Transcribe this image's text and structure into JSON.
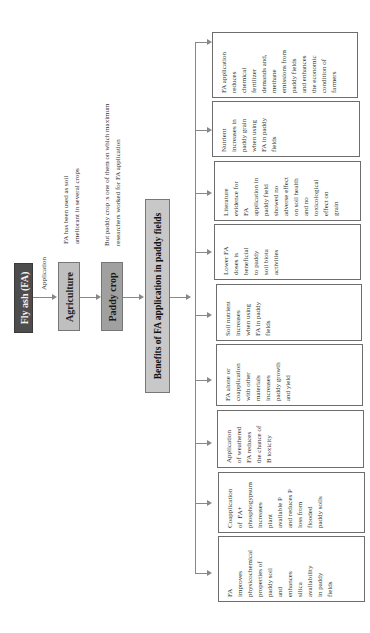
{
  "diagram": {
    "orientation": "rotated -90deg (text reads bottom-to-top)",
    "root": {
      "label": "Fly ash (FA)",
      "color": "#4d4d4d"
    },
    "edge_label_1": "Application",
    "node_agriculture": {
      "label": "Agriculture",
      "color": "#bfbfbf",
      "note_line1": "FA has been used as soil",
      "note_line2": "ameliorant in several crops"
    },
    "node_paddy": {
      "label": "Paddy crop",
      "color": "#a0a0a0",
      "note_line1": "But paddy crop :s one of them on which maximum",
      "note_line2": "researchers worked for FA application"
    },
    "node_benefits": {
      "label": "Benefits of FA application in paddy fields",
      "color": "#c8c8c8"
    },
    "benefits": [
      {
        "text": "FA application\nreduces\nchemical\nfertilizer\ndemands and,\nmethane\nemissions from\npaddy fields\nand enhances\nthe economic\ncondition of\nfarmers"
      },
      {
        "text": "Nutrient\nincreases in\npaddy grain\nwhen using\nFA in paddy\nfields"
      },
      {
        "text": "Literature\nevidence for\nFA\napplication in\npaddy field\nshowed no\nadverse effect\non soil health\nand no\ntoxicological\neffect on\ngrain"
      },
      {
        "text": "Lower FA\ndoses is\nbeneficial\nto paddy\nsoil biota\nactivities"
      },
      {
        "text": "Soil nutrient\nincreases\nwhen using\nFA in paddy\nfields"
      },
      {
        "text": "FA alone or\ncoapplication\nwith other\nmaterials\nincreases\npaddy growth\nand yield"
      },
      {
        "text": "Application\nof weathered\nFA reduces\nthe chance of\nB toxicity"
      },
      {
        "text": "Coapplication\nof  FA+\nphosphogypsum\nincreases\nplant\navailable P\nand reduces P\nloss from\nflooded\npaddy soils"
      },
      {
        "text": "FA\nimproves\nphysicochemical\nproperties of\npaddy soil\nand\nenhances\nsilica\navailability\nin paddy\nfields"
      }
    ]
  }
}
